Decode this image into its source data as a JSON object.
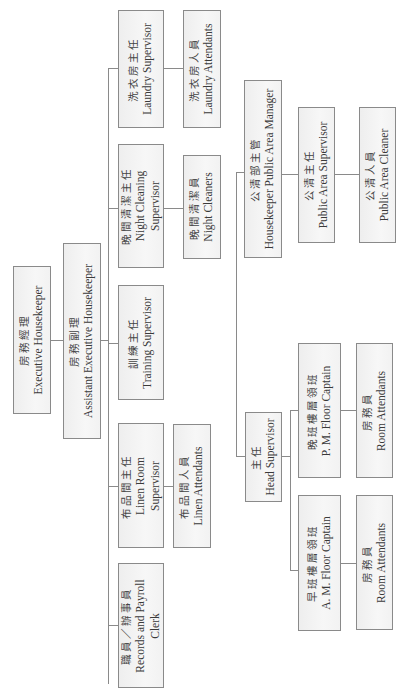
{
  "chart": {
    "orientation": "rotated-90-ccw",
    "root": {
      "zh": "房務經理",
      "en": "Executive Housekeeper"
    },
    "assistant": {
      "zh": "房務副理",
      "en": "Assistant Executive Housekeeper"
    },
    "departments": [
      {
        "id": "laundry",
        "supervisor": {
          "zh": "洗衣房主任",
          "en": "Laundry Supervisor"
        },
        "staff": {
          "zh": "洗衣房人員",
          "en": "Laundry Attendants"
        }
      },
      {
        "id": "night",
        "supervisor": {
          "zh": "晚間清潔主任",
          "en1": "Night Cleaning",
          "en2": "Supervisor"
        },
        "staff": {
          "zh": "晚間清潔員",
          "en": "Night Cleaners"
        }
      },
      {
        "id": "training",
        "supervisor": {
          "zh": "訓練主任",
          "en": "Training Supervisor"
        }
      },
      {
        "id": "linen",
        "supervisor": {
          "zh": "布品間主任",
          "en1": "Linen Room",
          "en2": "Supervisor"
        },
        "staff": {
          "zh": "布品間人員",
          "en": "Linen Attendants"
        }
      },
      {
        "id": "records",
        "supervisor": {
          "zh": "職員／辦事員",
          "en1": "Records and Payroll",
          "en2": "Clerk"
        }
      }
    ],
    "public_area": {
      "manager": {
        "zh": "公清部主管",
        "en": "Housekeeper Public Area Manager"
      },
      "supervisor": {
        "zh": "公清主任",
        "en": "Public Area Supervisor"
      },
      "staff": {
        "zh": "公清人員",
        "en": "Public Area Cleaner"
      }
    },
    "head_supervisor": {
      "title": {
        "zh": "主任",
        "en": "Head Supervisor"
      },
      "pm": {
        "captain": {
          "zh": "晚班樓層領班",
          "en": "P. M. Floor Captain"
        },
        "staff": {
          "zh": "房務員",
          "en": "Room Attendants"
        }
      },
      "am": {
        "captain": {
          "zh": "早班樓層領班",
          "en": "A. M. Floor Captain"
        },
        "staff": {
          "zh": "房務員",
          "en": "Room Attendants"
        }
      }
    }
  }
}
